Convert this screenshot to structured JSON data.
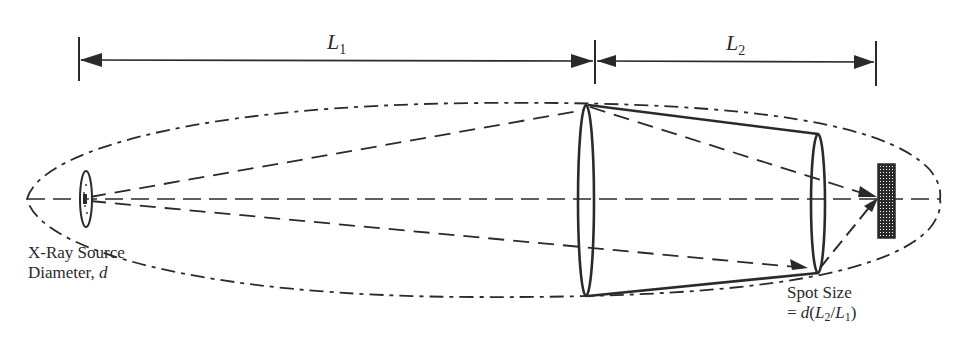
{
  "figure": {
    "type": "optics-schematic"
  },
  "dimensions": {
    "L1": {
      "label": "L",
      "subscript": "1",
      "x_start": 79,
      "x_end": 595,
      "y": 60
    },
    "L2": {
      "label": "L",
      "subscript": "2",
      "x_start": 595,
      "x_end": 876,
      "y": 61
    }
  },
  "labels": {
    "source_line1": "X-Ray Source",
    "source_line2_prefix": "Diameter, ",
    "source_line2_var": "d",
    "spot_line1": "Spot Size",
    "spot_line2_prefix": "= ",
    "spot_formula_d": "d",
    "spot_formula_open": "(",
    "spot_formula_L2": "L",
    "spot_formula_L2_sub": "2",
    "spot_formula_slash": "/",
    "spot_formula_L1": "L",
    "spot_formula_L1_sub": "1",
    "spot_formula_close": ")"
  },
  "elements": {
    "optical_axis_y": 199,
    "envelope": {
      "left_x": 27,
      "right_x": 940,
      "top_y": 103,
      "bottom_y": 297
    },
    "source": {
      "cx": 86,
      "cy": 199,
      "rx": 6,
      "ry": 28
    },
    "lens1": {
      "cx": 586,
      "top_y": 105,
      "bottom_y": 296,
      "rx": 8
    },
    "lens2": {
      "cx": 818,
      "top_y": 134,
      "bottom_y": 273,
      "rx": 7
    },
    "detector": {
      "x": 878,
      "y": 164,
      "width": 17,
      "height": 74
    }
  },
  "colors": {
    "ink": "#2a2a2a",
    "background": "#ffffff"
  }
}
